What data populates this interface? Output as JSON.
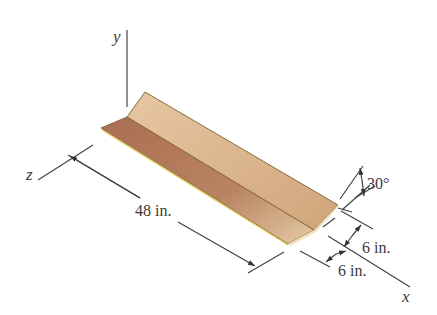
{
  "figure": {
    "axes": {
      "x": "x",
      "y": "y",
      "z": "z"
    },
    "dimensions": {
      "length": "48 in.",
      "leg_upper": "6 in.",
      "leg_lower": "6 in.",
      "angle": "30°"
    },
    "colors": {
      "upper_leg_face": "#d9b48e",
      "lower_leg_face": "#b0785a",
      "edge": "#8a6a3a",
      "highlight_edge": "#e8cc55"
    }
  }
}
